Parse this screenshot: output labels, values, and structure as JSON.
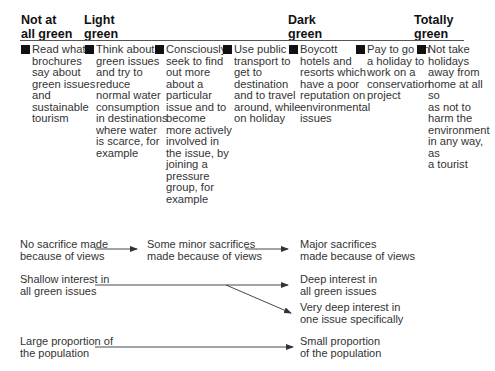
{
  "scale": {
    "headers": [
      {
        "label": "Not at all green",
        "lines": [
          "Not at",
          "all green"
        ]
      },
      {
        "label": "Light green",
        "lines": [
          "Light",
          "green"
        ]
      },
      {
        "label": "Dark green",
        "lines": [
          "Dark",
          "green"
        ]
      },
      {
        "label": "Totally green",
        "lines": [
          "Totally",
          "green"
        ]
      }
    ]
  },
  "behaviours": [
    {
      "lines": [
        "Read what",
        "brochures",
        "say about",
        "green issues",
        "and",
        "sustainable",
        "tourism"
      ]
    },
    {
      "lines": [
        "Think about",
        "green issues",
        "and try to",
        "reduce",
        "normal water",
        "consumption",
        "in destinations",
        "where water",
        "is scarce, for",
        "example"
      ]
    },
    {
      "lines": [
        "Consciously",
        "seek to find",
        "out more",
        "about a",
        "particular",
        "issue and to",
        "become",
        "more actively",
        "involved in",
        "the issue, by",
        "joining a",
        "pressure",
        "group, for",
        "example"
      ]
    },
    {
      "lines": [
        "Use public",
        "transport to",
        "get to",
        "destination",
        "and to travel",
        "around, while",
        "on holiday"
      ]
    },
    {
      "lines": [
        "Boycott",
        "hotels and",
        "resorts which",
        "have a poor",
        "reputation on",
        "environmental",
        "issues"
      ]
    },
    {
      "lines": [
        "Pay to go on",
        "a holiday to",
        "work on a",
        "conservation",
        "project"
      ]
    },
    {
      "lines": [
        "Not take",
        "holidays",
        "away from",
        "home at all so",
        "as not to",
        "harm the",
        "environment",
        "in any way, as",
        "a tourist"
      ]
    }
  ],
  "flows": {
    "sacrifice": {
      "start": [
        "No sacrifice made",
        "because of views"
      ],
      "middle": [
        "Some minor sacrifices",
        "made because of views"
      ],
      "end": [
        "Major sacrifices",
        "made because of views"
      ]
    },
    "interest": {
      "start": [
        "Shallow interest in",
        "all green issues"
      ],
      "end_a": [
        "Deep interest in",
        "all green issues"
      ],
      "end_b": [
        "Very deep interest in",
        "one issue specifically"
      ]
    },
    "population": {
      "start": [
        "Large proportion of",
        "the population"
      ],
      "end": [
        "Small proportion",
        "of the population"
      ]
    }
  }
}
